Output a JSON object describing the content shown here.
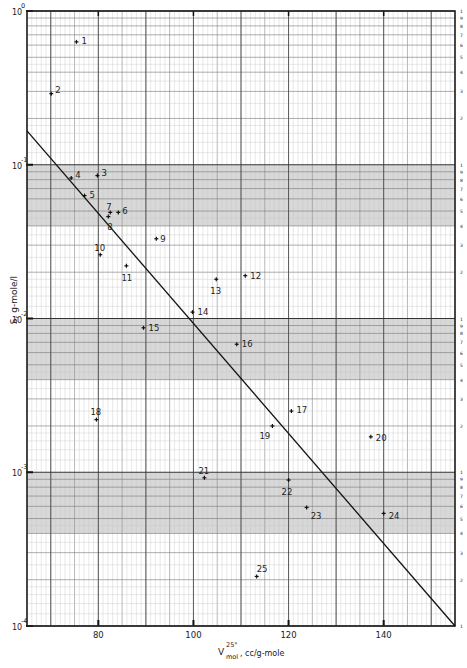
{
  "chart_data": {
    "type": "scatter",
    "title": "",
    "xlabel": "V_mol^25°, cc/g-mole",
    "xlabel_parts": {
      "main": "V",
      "sup": "25°",
      "sub": "mol",
      "units": ", cc/g-mole"
    },
    "ylabel": "S, g-mole/l",
    "yscale": "log",
    "xlim": [
      65,
      155
    ],
    "ylim": [
      0.0001,
      1
    ],
    "grid": true,
    "x_ticks": [
      80,
      100,
      120,
      140
    ],
    "x_tick_labels": [
      "80",
      "100",
      "120",
      "140"
    ],
    "y_ticks": [
      1,
      0.1,
      0.01,
      0.001,
      0.0001
    ],
    "y_tick_labels": [
      {
        "base": "10",
        "exp": "0"
      },
      {
        "base": "10",
        "exp": "-1"
      },
      {
        "base": "10",
        "exp": "-2"
      },
      {
        "base": "10",
        "exp": "-3"
      },
      {
        "base": "10",
        "exp": "-4"
      }
    ],
    "right_minor_labels": [
      "1",
      "9",
      "8",
      "7",
      "6",
      "5",
      "4",
      "3",
      "2"
    ],
    "points": [
      {
        "id": "1",
        "x": 75.4,
        "y": 0.63
      },
      {
        "id": "2",
        "x": 70.1,
        "y": 0.29
      },
      {
        "id": "3",
        "x": 79.8,
        "y": 0.085
      },
      {
        "id": "4",
        "x": 74.3,
        "y": 0.082
      },
      {
        "id": "5",
        "x": 77.1,
        "y": 0.063
      },
      {
        "id": "6",
        "x": 84.2,
        "y": 0.049
      },
      {
        "id": "7",
        "x": 82.5,
        "y": 0.049
      },
      {
        "id": "8",
        "x": 82.1,
        "y": 0.046
      },
      {
        "id": "9",
        "x": 92.2,
        "y": 0.033
      },
      {
        "id": "10",
        "x": 80.4,
        "y": 0.026
      },
      {
        "id": "11",
        "x": 85.9,
        "y": 0.022
      },
      {
        "id": "12",
        "x": 110.9,
        "y": 0.019
      },
      {
        "id": "13",
        "x": 104.8,
        "y": 0.018
      },
      {
        "id": "14",
        "x": 99.8,
        "y": 0.011
      },
      {
        "id": "15",
        "x": 89.5,
        "y": 0.0087
      },
      {
        "id": "16",
        "x": 109.1,
        "y": 0.0068
      },
      {
        "id": "17",
        "x": 120.6,
        "y": 0.0025
      },
      {
        "id": "18",
        "x": 79.6,
        "y": 0.0022
      },
      {
        "id": "19",
        "x": 116.6,
        "y": 0.002
      },
      {
        "id": "20",
        "x": 137.3,
        "y": 0.0017
      },
      {
        "id": "21",
        "x": 102.3,
        "y": 0.00092
      },
      {
        "id": "22",
        "x": 120.0,
        "y": 0.00089
      },
      {
        "id": "23",
        "x": 123.8,
        "y": 0.00059
      },
      {
        "id": "24",
        "x": 140.0,
        "y": 0.00054
      },
      {
        "id": "25",
        "x": 113.3,
        "y": 0.00021
      }
    ],
    "label_offsets": {
      "1": [
        5,
        -1
      ],
      "2": [
        4,
        -4
      ],
      "3": [
        4,
        -3
      ],
      "4": [
        4,
        -3
      ],
      "5": [
        5,
        -1
      ],
      "6": [
        4,
        -1
      ],
      "7": [
        -4,
        -5
      ],
      "8": [
        -1,
        10
      ],
      "9": [
        4,
        0
      ],
      "10": [
        -6,
        -7
      ],
      "11": [
        -5,
        12
      ],
      "12": [
        5,
        0
      ],
      "13": [
        -6,
        12
      ],
      "14": [
        5,
        0
      ],
      "15": [
        5,
        0
      ],
      "16": [
        5,
        0
      ],
      "17": [
        5,
        -1
      ],
      "18": [
        -6,
        -8
      ],
      "19": [
        -13,
        10
      ],
      "20": [
        5,
        1
      ],
      "21": [
        -6,
        -7
      ],
      "22": [
        -7,
        12
      ],
      "23": [
        4,
        9
      ],
      "24": [
        5,
        3
      ],
      "25": [
        0,
        -7
      ]
    },
    "fit_line": {
      "x": [
        65,
        155
      ],
      "y": [
        0.166,
        0.0001
      ]
    },
    "legend": null
  }
}
